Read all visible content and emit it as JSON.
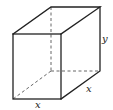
{
  "diagram": {
    "type": "rectangular-box",
    "labels": {
      "height": "y",
      "depth": "x",
      "width": "x"
    },
    "colors": {
      "stroke": "#222222",
      "hidden_stroke": "#555555",
      "background": "#ffffff"
    }
  }
}
